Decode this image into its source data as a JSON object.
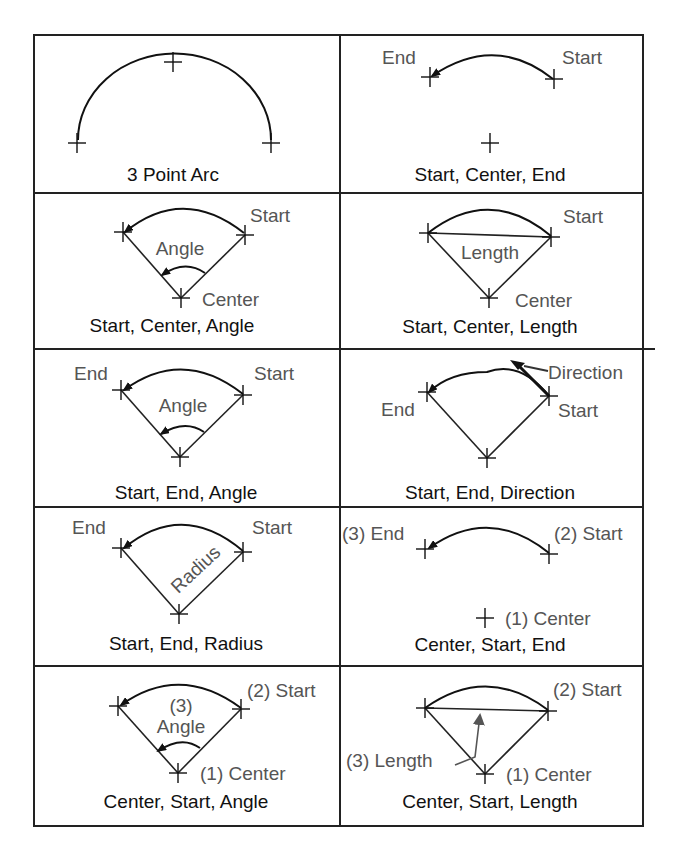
{
  "cells": [
    {
      "id": "three-point",
      "caption": "3 Point Arc",
      "labels": []
    },
    {
      "id": "start-center-end",
      "caption": "Start, Center, End",
      "labels": [
        "End",
        "Start"
      ]
    },
    {
      "id": "start-center-angle",
      "caption": "Start, Center, Angle",
      "labels": [
        "Start",
        "Angle",
        "Center"
      ]
    },
    {
      "id": "start-center-length",
      "caption": "Start, Center, Length",
      "labels": [
        "Start",
        "Length",
        "Center"
      ]
    },
    {
      "id": "start-end-angle",
      "caption": "Start, End, Angle",
      "labels": [
        "End",
        "Start",
        "Angle"
      ]
    },
    {
      "id": "start-end-direction",
      "caption": "Start, End, Direction",
      "labels": [
        "Direction",
        "End",
        "Start"
      ]
    },
    {
      "id": "start-end-radius",
      "caption": "Start, End, Radius",
      "labels": [
        "End",
        "Start",
        "Radius"
      ]
    },
    {
      "id": "center-start-end",
      "caption": "Center, Start, End",
      "labels": [
        "(3) End",
        "(2) Start",
        "(1) Center"
      ]
    },
    {
      "id": "center-start-angle",
      "caption": "Center, Start, Angle",
      "labels": [
        "(2) Start",
        "(3)",
        "Angle",
        "(1) Center"
      ]
    },
    {
      "id": "center-start-length",
      "caption": "Center, Start, Length",
      "labels": [
        "(2) Start",
        "(3) Length",
        "(1) Center"
      ]
    }
  ],
  "colors": {
    "line": "#111111",
    "label": "#555555",
    "caption": "#111111"
  }
}
